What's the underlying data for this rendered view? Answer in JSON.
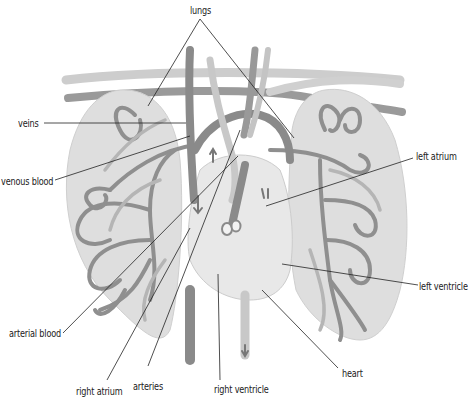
{
  "figure": {
    "type": "anatomical-diagram",
    "colors": {
      "background": "#ffffff",
      "lung_fill": "#dcdcdc",
      "lung_edge": "#cfcfcf",
      "heart_fill": "#e6e6e6",
      "vein_dark": "#8a8a8a",
      "vessel_light": "#c4c4c4",
      "leader_line": "#222222",
      "label_text": "#222222"
    }
  },
  "labels": {
    "lungs": "lungs",
    "veins": "veins",
    "venous_blood": "venous blood",
    "left_atrium": "left atrium",
    "left_ventricle": "left ventricle",
    "arterial_blood": "arterial blood",
    "right_atrium": "right atrium",
    "arteries": "arteries",
    "right_ventricle": "right ventricle",
    "heart": "heart"
  }
}
